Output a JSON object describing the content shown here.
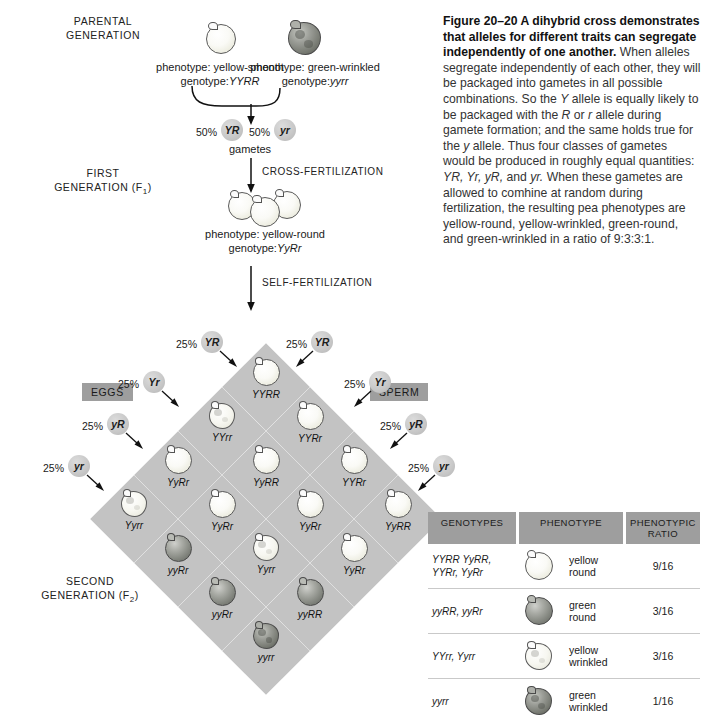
{
  "figure": {
    "number": "Figure 20–20",
    "title": "A dihybrid cross demonstrates that alleles for different traits can segregate independently of one another.",
    "body_1": " When alleles segregate independently of each other, they will be packaged into gametes in all possible combinations. So the ",
    "it_Y": "Y",
    "body_2": " allele is equally likely to be packaged with the ",
    "it_R": "R",
    "body_3": " or ",
    "it_r": "r",
    "body_4": " allele during gamete formation; and the same holds true for the ",
    "it_y": "y",
    "body_5": " allele. Thus four classes of gametes would be produced in roughly equal quantities: ",
    "it_gametes": "YR, Yr, yR,",
    "body_6": " and ",
    "it_yr": "yr.",
    "body_7": " When these gametes are allowed to comhine at random during fertilization, the resulting pea phenotypes are yellow-round, yellow-wrinkled, green-round, and green-wrinkled in a ratio of 9:3:3:1."
  },
  "generations": {
    "parental": "PARENTAL\nGENERATION",
    "parental_line1": "PARENTAL",
    "parental_line2": "GENERATION",
    "first_line1": "FIRST",
    "first_line2": "GENERATION (F",
    "first_sub": "1",
    "first_end": ")",
    "second_line1": "SECOND",
    "second_line2": "GENERATION (F",
    "second_sub": "2",
    "second_end": ")"
  },
  "parents": {
    "left": {
      "phenotype_label": "phenotype: yellow-smooth",
      "genotype_label": "genotype:",
      "genotype": "YYRR",
      "pea_type": "yellow-smooth-pea"
    },
    "right": {
      "phenotype_label": "phenotype: green-wrinkled",
      "genotype_label": "genotype:",
      "genotype": "yyrr",
      "pea_type": "green-wrinkled-pea"
    }
  },
  "parental_gametes": {
    "left_pct": "50%",
    "left_allele": "YR",
    "right_pct": "50%",
    "right_allele": "yr",
    "caption": "gametes"
  },
  "steps": {
    "cross_fertilization": "CROSS-FERTILIZATION",
    "self_fertilization": "SELF-FERTILIZATION"
  },
  "f1": {
    "phenotype_label": "phenotype: yellow-round",
    "genotype_label": "genotype:",
    "genotype": "YyRr"
  },
  "axis_tags": {
    "eggs": "EGGS",
    "sperm": "SPERM"
  },
  "egg_gametes": [
    {
      "pct": "25%",
      "allele": "YR"
    },
    {
      "pct": "25%",
      "allele": "Yr"
    },
    {
      "pct": "25%",
      "allele": "yR"
    },
    {
      "pct": "25%",
      "allele": "yr"
    }
  ],
  "sperm_gametes": [
    {
      "pct": "25%",
      "allele": "YR"
    },
    {
      "pct": "25%",
      "allele": "Yr"
    },
    {
      "pct": "25%",
      "allele": "yR"
    },
    {
      "pct": "25%",
      "allele": "yr"
    }
  ],
  "punnett_cells": [
    {
      "genotype": "YYRR",
      "pea": "yellow-round"
    },
    {
      "genotype": "YYRr",
      "pea": "yellow-round"
    },
    {
      "genotype": "YYRr",
      "pea": "yellow-round"
    },
    {
      "genotype": "YyRR",
      "pea": "yellow-round"
    },
    {
      "genotype": "YYrr",
      "pea": "yellow-wrinkled"
    },
    {
      "genotype": "YyRR",
      "pea": "yellow-round"
    },
    {
      "genotype": "YyRr",
      "pea": "yellow-round"
    },
    {
      "genotype": "YyRr",
      "pea": "yellow-round"
    },
    {
      "genotype": "YyRr",
      "pea": "yellow-round"
    },
    {
      "genotype": "YyRr",
      "pea": "yellow-round"
    },
    {
      "genotype": "Yyrr",
      "pea": "yellow-wrinkled"
    },
    {
      "genotype": "yyRR",
      "pea": "green-round"
    },
    {
      "genotype": "Yyrr",
      "pea": "yellow-wrinkled"
    },
    {
      "genotype": "yyRr",
      "pea": "green-round"
    },
    {
      "genotype": "yyRr",
      "pea": "green-round"
    },
    {
      "genotype": "yyrr",
      "pea": "green-wrinkled"
    }
  ],
  "results_table": {
    "headers": {
      "genotypes": "GENOTYPES",
      "phenotype": "PHENOTYPE",
      "ratio_line1": "PHENOTYPIC",
      "ratio_line2": "RATIO"
    },
    "rows": [
      {
        "genotypes_line1": "YYRR YyRR,",
        "genotypes_line2": "YYRr, YyRr",
        "pea": "yellow-round",
        "phenotype_line1": "yellow",
        "phenotype_line2": "round",
        "ratio": "9/16"
      },
      {
        "genotypes_line1": "yyRR, yyRr",
        "genotypes_line2": "",
        "pea": "green-round",
        "phenotype_line1": "green",
        "phenotype_line2": "round",
        "ratio": "3/16"
      },
      {
        "genotypes_line1": "YYrr, Yyrr",
        "genotypes_line2": "",
        "pea": "yellow-wrinkled",
        "phenotype_line1": "yellow",
        "phenotype_line2": "wrinkled",
        "ratio": "3/16"
      },
      {
        "genotypes_line1": "yyrr",
        "genotypes_line2": "",
        "pea": "green-wrinkled",
        "phenotype_line1": "green",
        "phenotype_line2": "wrinkled",
        "ratio": "1/16"
      }
    ]
  },
  "colors": {
    "cell_fill": "#c3c3c3",
    "tag_fill": "#9e9e9e",
    "badge_fill": "#c9c9c9",
    "stroke": "#4a4a4a"
  }
}
